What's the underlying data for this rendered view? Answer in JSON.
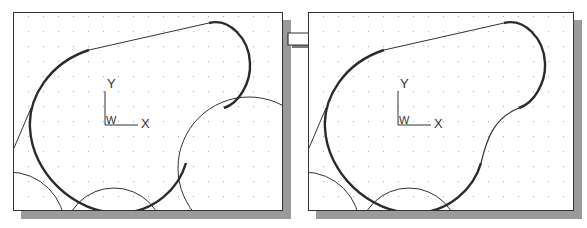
{
  "figure": {
    "arrow_icon": "right-arrow-icon"
  },
  "panels": [
    {
      "id": "before",
      "frame": {
        "x": 13,
        "y": 12,
        "w": 270,
        "h": 199
      },
      "ucs": {
        "y_label": "Y",
        "x_label": "X",
        "origin_label": "W"
      },
      "helper_circles": [
        "large-right-circle",
        "bottom-left-circle",
        "bottom-center-circle"
      ]
    },
    {
      "id": "after",
      "frame": {
        "x": 308,
        "y": 12,
        "w": 266,
        "h": 199
      },
      "ucs": {
        "y_label": "Y",
        "x_label": "X",
        "origin_label": "W"
      },
      "helper_circles": [
        "bottom-left-circle",
        "bottom-center-circle"
      ]
    }
  ],
  "colors": {
    "frame": "#333333",
    "shadow": "#9a9a9a",
    "outline": "#2a2a2a",
    "thin_line": "#333333",
    "grid_dot": "#b0b0b0"
  },
  "grid": {
    "spacing": 15
  }
}
